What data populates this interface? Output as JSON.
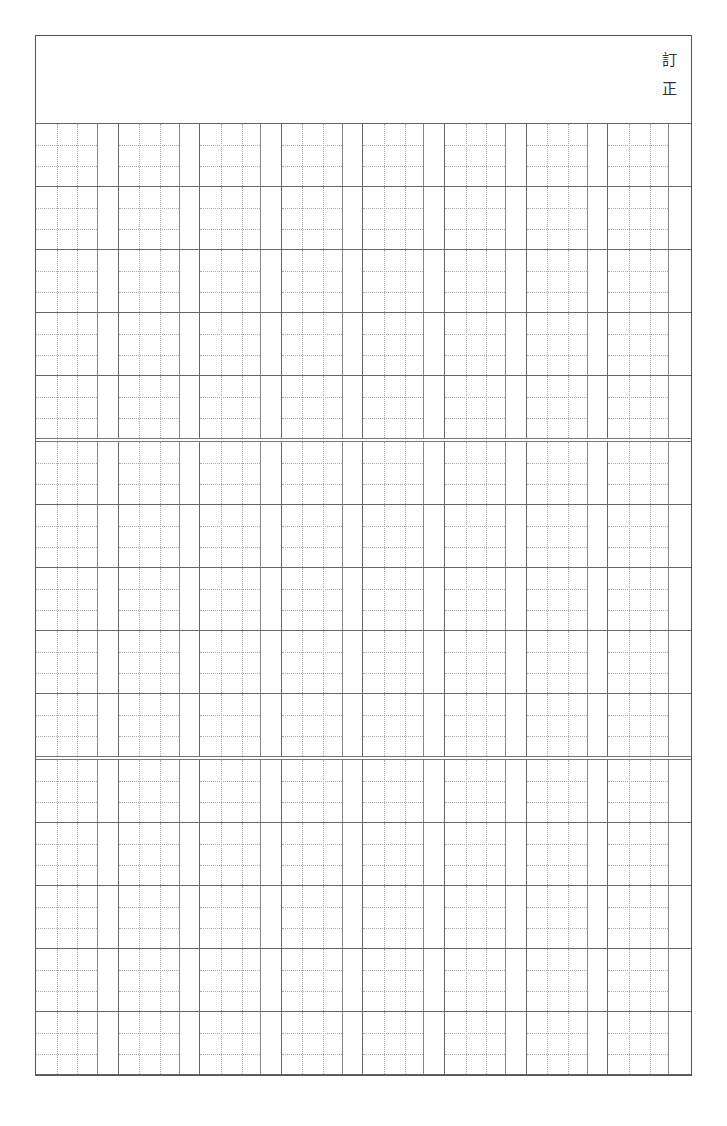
{
  "header": {
    "label": "訂正",
    "label_chars": [
      "訂",
      "正"
    ]
  },
  "grid": {
    "sections": 3,
    "rows_per_section": 5,
    "columns": 8,
    "cell_width": 62,
    "gap_width": 20,
    "row_height": 63,
    "line_color": "#666666",
    "dotted_color": "#aaaaaa"
  }
}
